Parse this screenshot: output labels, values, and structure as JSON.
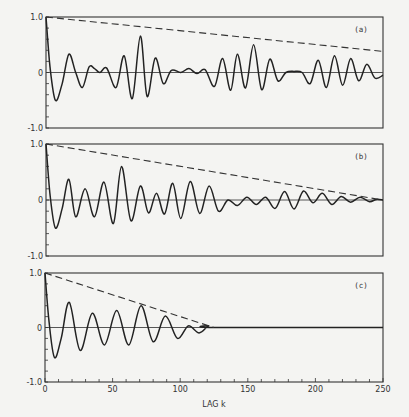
{
  "chart_data": [
    {
      "type": "line",
      "panel_label": "(a)",
      "xlabel": "LAG k",
      "ylabel": "",
      "xlim": [
        0,
        250
      ],
      "ylim": [
        -1.0,
        1.0
      ],
      "y_ticks": [
        "1.0",
        "0",
        "-1.0"
      ],
      "series": [
        {
          "name": "autocorrelation",
          "style": "solid",
          "description": "oscillating autocorrelation function, not decaying",
          "x": [
            0,
            3,
            7,
            12,
            17,
            22,
            27,
            32,
            36,
            40,
            45,
            52,
            58,
            64,
            70,
            75,
            81,
            87,
            93,
            100,
            106,
            112,
            118,
            125,
            131,
            137,
            142,
            148,
            154,
            160,
            166,
            172,
            178,
            184,
            190,
            196,
            202,
            208,
            214,
            220,
            226,
            232,
            238,
            244,
            250
          ],
          "y": [
            1.0,
            0.1,
            -0.5,
            -0.2,
            0.33,
            0.0,
            -0.27,
            0.1,
            0.07,
            0.0,
            0.08,
            -0.27,
            0.3,
            -0.47,
            0.66,
            -0.43,
            0.26,
            -0.2,
            0.04,
            0.0,
            0.07,
            -0.02,
            0.05,
            -0.25,
            0.25,
            -0.32,
            0.33,
            -0.28,
            0.5,
            -0.31,
            0.24,
            -0.15,
            0.0,
            0.02,
            0.0,
            -0.2,
            0.22,
            -0.27,
            0.3,
            -0.23,
            0.25,
            -0.15,
            0.15,
            -0.1,
            -0.05
          ]
        },
        {
          "name": "envelope",
          "style": "dashed",
          "x": [
            0,
            250
          ],
          "y": [
            1.0,
            0.38
          ]
        }
      ]
    },
    {
      "type": "line",
      "panel_label": "(b)",
      "xlabel": "LAG k",
      "xlim": [
        0,
        250
      ],
      "ylim": [
        -1.0,
        1.0
      ],
      "y_ticks": [
        "1.0",
        "0",
        "-1.0"
      ],
      "series": [
        {
          "name": "autocorrelation",
          "style": "solid",
          "description": "oscillating autocorrelation damping to zero at k=250",
          "x": [
            0,
            3,
            7,
            12,
            17,
            22,
            29,
            36,
            43,
            50,
            56,
            63,
            70,
            76,
            82,
            88,
            94,
            100,
            107,
            114,
            121,
            128,
            135,
            142,
            149,
            156,
            163,
            170,
            177,
            184,
            191,
            198,
            205,
            212,
            219,
            226,
            233,
            240,
            245,
            250
          ],
          "y": [
            1.0,
            0.1,
            -0.5,
            -0.15,
            0.37,
            -0.3,
            0.2,
            -0.3,
            0.32,
            -0.42,
            0.6,
            -0.37,
            0.25,
            -0.23,
            0.12,
            -0.25,
            0.3,
            -0.33,
            0.33,
            -0.24,
            0.25,
            -0.2,
            0.0,
            -0.1,
            0.05,
            -0.08,
            0.05,
            -0.15,
            0.15,
            -0.16,
            0.16,
            -0.05,
            0.12,
            -0.08,
            0.06,
            -0.04,
            0.05,
            -0.03,
            0.01,
            0.0
          ]
        },
        {
          "name": "envelope",
          "style": "dashed",
          "x": [
            0,
            250
          ],
          "y": [
            1.0,
            0.0
          ]
        }
      ]
    },
    {
      "type": "line",
      "panel_label": "(c)",
      "xlabel": "LAG k",
      "xlim": [
        0,
        250
      ],
      "ylim": [
        -1.0,
        1.0
      ],
      "x_ticks": [
        "0",
        "50",
        "100",
        "150",
        "200",
        "250"
      ],
      "y_ticks": [
        "1.0",
        "0",
        "-1.0"
      ],
      "series": [
        {
          "name": "autocorrelation",
          "style": "solid",
          "description": "oscillating autocorrelation damping to zero at k=125",
          "x": [
            0,
            3,
            7,
            12,
            18,
            26,
            35,
            44,
            53,
            62,
            71,
            80,
            89,
            98,
            106,
            114,
            121,
            125,
            250
          ],
          "y": [
            1.0,
            0.1,
            -0.55,
            -0.2,
            0.46,
            -0.42,
            0.26,
            -0.32,
            0.31,
            -0.32,
            0.4,
            -0.26,
            0.21,
            -0.2,
            0.03,
            -0.1,
            0.03,
            0.0,
            0.0
          ]
        },
        {
          "name": "envelope",
          "style": "dashed",
          "x": [
            0,
            125
          ],
          "y": [
            1.0,
            0.0
          ]
        }
      ]
    }
  ],
  "labels": {
    "panel_a": "(a)",
    "panel_b": "(b)",
    "panel_c": "(c)",
    "y_top": "1.0",
    "y_zero": "0",
    "y_bottom": "-1.0",
    "x_ticks": [
      "0",
      "50",
      "100",
      "150",
      "200",
      "250"
    ],
    "xlabel": "LAG k"
  }
}
